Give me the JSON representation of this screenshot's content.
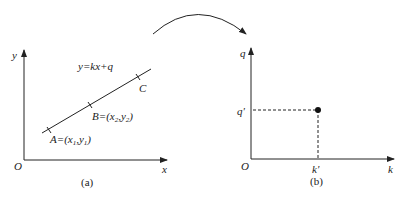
{
  "panel_a": {
    "caption": "(a)",
    "y_axis_label": "y",
    "x_axis_label": "x",
    "origin_label": "O",
    "equation": "y=kx+q",
    "points": [
      {
        "name": "A",
        "label_prefix": "A=(x",
        "sub1": "1",
        "mid": ",y",
        "sub2": "1",
        "suffix": ")"
      },
      {
        "name": "B",
        "label_prefix": "B=(x",
        "sub1": "2",
        "mid": ",y",
        "sub2": "2",
        "suffix": ")"
      },
      {
        "name": "C",
        "label": "C"
      }
    ]
  },
  "panel_b": {
    "caption": "(b)",
    "y_axis_label": "q",
    "x_axis_label": "k",
    "origin_label": "O",
    "point_q_label": "q'",
    "point_k_label": "k'"
  },
  "colors": {
    "stroke": "#222222",
    "background": "#ffffff"
  }
}
